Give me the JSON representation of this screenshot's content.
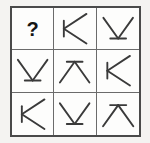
{
  "puzzle": {
    "type": "matrix-reasoning-3x3",
    "question_mark": "?",
    "grid": {
      "rows": 3,
      "columns": 3
    },
    "colors": {
      "background": "#f4f3f1",
      "cell_background": "#fdfdfc",
      "outer_border": "#4a4a4a",
      "inner_grid_line": "#6b6b6b",
      "stroke": "#3a3a3a",
      "question_mark": "#151515"
    },
    "cells": [
      {
        "index": 1,
        "row": 1,
        "column": 1,
        "figure": "question-mark",
        "label": "?",
        "description": "unknown missing element"
      },
      {
        "index": 2,
        "row": 1,
        "column": 2,
        "figure": "chevron-left",
        "label": "K",
        "description": "left-pointing chevron with vertical tick at vertex"
      },
      {
        "index": 3,
        "row": 1,
        "column": 3,
        "figure": "chevron-down",
        "label": "V",
        "description": "down-pointing chevron with horizontal tick at vertex"
      },
      {
        "index": 4,
        "row": 2,
        "column": 1,
        "figure": "chevron-down",
        "label": "V",
        "description": "down-pointing chevron with horizontal tick at vertex"
      },
      {
        "index": 5,
        "row": 2,
        "column": 2,
        "figure": "chevron-up",
        "label": "A",
        "description": "up-pointing chevron with horizontal tick at vertex"
      },
      {
        "index": 6,
        "row": 2,
        "column": 3,
        "figure": "chevron-left",
        "label": "K",
        "description": "left-pointing chevron with vertical tick at vertex"
      },
      {
        "index": 7,
        "row": 3,
        "column": 1,
        "figure": "chevron-left",
        "label": "K",
        "description": "left-pointing chevron with vertical tick at vertex"
      },
      {
        "index": 8,
        "row": 3,
        "column": 2,
        "figure": "chevron-down",
        "label": "V",
        "description": "down-pointing chevron with horizontal tick at vertex"
      },
      {
        "index": 9,
        "row": 3,
        "column": 3,
        "figure": "chevron-up",
        "label": "A",
        "description": "up-pointing chevron with horizontal tick at vertex"
      }
    ]
  }
}
